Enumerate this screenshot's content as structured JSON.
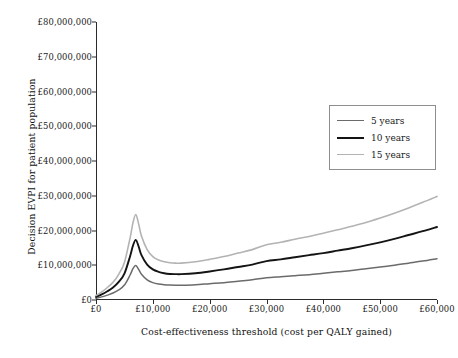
{
  "chart_data": {
    "type": "line",
    "title": "",
    "xlabel": "Cost-effectiveness threshold (cost per QALY gained)",
    "ylabel": "Decision EVPI for patient population",
    "xlim": [
      0,
      60000
    ],
    "ylim": [
      0,
      80000000
    ],
    "grid": false,
    "legend_position": "top-right",
    "x_tick_labels": [
      "£0",
      "£10,000",
      "£20,000",
      "£30,000",
      "£40,000",
      "£50,000",
      "£60,000"
    ],
    "x_tick_values": [
      0,
      10000,
      20000,
      30000,
      40000,
      50000,
      60000
    ],
    "y_tick_labels": [
      "£0",
      "£10,000,000",
      "£20,000,000",
      "£30,000,000",
      "£40,000,000",
      "£50,000,000",
      "£60,000,000",
      "£70,000,000",
      "£80,000,000"
    ],
    "y_tick_values": [
      0,
      10000000,
      20000000,
      30000000,
      40000000,
      50000000,
      60000000,
      70000000,
      80000000
    ],
    "x": [
      0,
      1000,
      2000,
      3000,
      4000,
      5000,
      6000,
      6500,
      7000,
      7500,
      8000,
      9000,
      10000,
      11000,
      12000,
      13000,
      14000,
      15000,
      17500,
      20000,
      22500,
      25000,
      27500,
      30000,
      32500,
      35000,
      37500,
      40000,
      42500,
      45000,
      47500,
      50000,
      52500,
      55000,
      57500,
      60000
    ],
    "series": [
      {
        "name": "5 years",
        "color": "#6b6b6b",
        "width": 1.5,
        "values": [
          500000,
          900000,
          1400000,
          2000000,
          2900000,
          4300000,
          7200000,
          9000000,
          9900000,
          8800000,
          7400000,
          5800000,
          5000000,
          4600000,
          4400000,
          4300000,
          4250000,
          4250000,
          4400000,
          4700000,
          5000000,
          5400000,
          5800000,
          6400000,
          6700000,
          7000000,
          7300000,
          7700000,
          8100000,
          8500000,
          9000000,
          9500000,
          10000000,
          10600000,
          11200000,
          11900000
        ]
      },
      {
        "name": "10 years",
        "color": "#141414",
        "width": 1.9,
        "values": [
          900000,
          1600000,
          2500000,
          3600000,
          5200000,
          7600000,
          12600000,
          15600000,
          17300000,
          15400000,
          12900000,
          10200000,
          8800000,
          8100000,
          7700000,
          7500000,
          7450000,
          7450000,
          7700000,
          8200000,
          8800000,
          9500000,
          10200000,
          11200000,
          11700000,
          12300000,
          12900000,
          13500000,
          14200000,
          14900000,
          15700000,
          16600000,
          17600000,
          18700000,
          19800000,
          21000000
        ]
      },
      {
        "name": "15 years",
        "color": "#b3b3b3",
        "width": 1.6,
        "values": [
          1300000,
          2300000,
          3600000,
          5100000,
          7400000,
          10800000,
          17900000,
          22200000,
          24600000,
          21900000,
          18400000,
          14500000,
          12500000,
          11500000,
          11000000,
          10700000,
          10600000,
          10600000,
          11000000,
          11700000,
          12500000,
          13500000,
          14500000,
          15900000,
          16600000,
          17500000,
          18300000,
          19200000,
          20200000,
          21200000,
          22300000,
          23600000,
          25000000,
          26500000,
          28100000,
          29800000
        ]
      }
    ]
  },
  "legend": {
    "items": [
      {
        "label": "5 years",
        "color": "#6b6b6b"
      },
      {
        "label": "10 years",
        "color": "#141414"
      },
      {
        "label": "15 years",
        "color": "#b3b3b3"
      }
    ]
  },
  "axes": {
    "x_title": "Cost-effectiveness threshold (cost per QALY gained)",
    "y_title": "Decision EVPI for patient population"
  }
}
